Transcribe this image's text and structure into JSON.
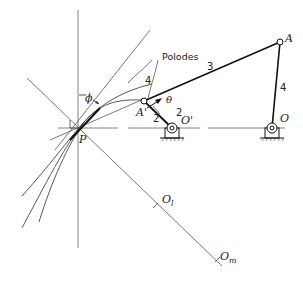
{
  "diagram": {
    "labels": {
      "polodes": "Polodes",
      "P": "P",
      "A": "A",
      "A_prime": "A'",
      "O": "O",
      "O_prime": "O'",
      "O_l": "O",
      "O_l_sub": "l",
      "O_m": "O",
      "O_m_sub": "m",
      "phi": "ϕ",
      "theta": "θ"
    },
    "links": {
      "link3": "3",
      "link4_right": "4",
      "link4_curve": "4",
      "link2_lower": "2",
      "link2_upper": "2"
    },
    "colors": {
      "line": "#222222",
      "thin": "#555555",
      "background": "#ffffff"
    }
  }
}
